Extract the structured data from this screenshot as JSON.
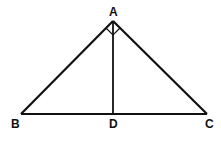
{
  "diagram": {
    "type": "geometry-triangle",
    "points": {
      "A": {
        "label": "A",
        "x": 113,
        "y": 21
      },
      "B": {
        "label": "B",
        "x": 21,
        "y": 114
      },
      "C": {
        "label": "C",
        "x": 207,
        "y": 114
      },
      "D": {
        "label": "D",
        "x": 113,
        "y": 114
      }
    },
    "segments": [
      "AB",
      "AC",
      "BC",
      "AD"
    ],
    "annotations": [
      "right-angle-mark-at-A"
    ],
    "stroke_color": "#111111"
  }
}
